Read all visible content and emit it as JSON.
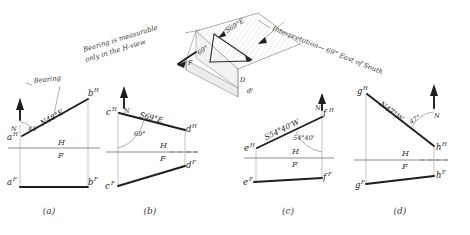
{
  "figure": {
    "annotations": [
      {
        "id": "note-h-view",
        "text_line1": "Bearing is measurable",
        "text_line2": "only in the H-view"
      },
      {
        "id": "note-interpretation",
        "text": "Interpretation— 69° East of South"
      },
      {
        "id": "callout-bearing",
        "text": "Bearing"
      }
    ],
    "pictorial": {
      "name": "pictorial-3d-block",
      "labels": [
        "F",
        "D",
        "S69°E",
        "69°",
        "dᶠ"
      ]
    },
    "fold_line": {
      "upper": "H",
      "lower": "F"
    },
    "north_label": "N",
    "panels": [
      {
        "caption": "(a)",
        "points": {
          "h_start": "a",
          "h_end": "b",
          "f_start": "a",
          "f_end": "b"
        },
        "sup_h": "H",
        "sup_f": "F",
        "bearing": "N48°E",
        "angle": "48°",
        "north": "N"
      },
      {
        "caption": "(b)",
        "points": {
          "h_start": "c",
          "h_end": "d",
          "f_start": "c",
          "f_end": "d"
        },
        "sup_h": "H",
        "sup_f": "F",
        "bearing": "S69°E",
        "angle": "69°",
        "north": "N"
      },
      {
        "caption": "(c)",
        "points": {
          "h_start": "e",
          "h_end": "f",
          "f_start": "e",
          "f_end": "f"
        },
        "sup_h": "H",
        "sup_f": "F",
        "bearing": "S54°40'W",
        "angle": "54°40'",
        "north": "N"
      },
      {
        "caption": "(d)",
        "points": {
          "h_start": "g",
          "h_end": "h",
          "f_start": "g",
          "f_end": "h"
        },
        "sup_h": "H",
        "sup_f": "F",
        "bearing": "N47°W",
        "angle": "47°",
        "north": "N"
      }
    ],
    "colors": {
      "ink": "#1e1e1e",
      "light_line": "#9a9a9a",
      "paper": "#ffffff",
      "pictorial_fill": "#ececec"
    }
  }
}
